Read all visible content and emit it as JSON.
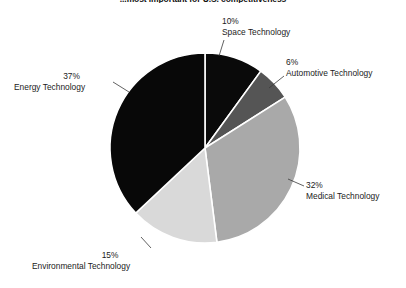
{
  "chart_data": {
    "type": "pie",
    "title": "...most important for U.S. competitiveness",
    "xlabel": "",
    "ylabel": "",
    "legend": "none",
    "grid": false,
    "start_angle_deg": 0,
    "direction": "clockwise",
    "categories": [
      "Space Technology",
      "Automotive Technology",
      "Medical Technology",
      "Environmental Technology",
      "Energy Technology"
    ],
    "values": [
      10,
      6,
      32,
      15,
      37
    ],
    "value_labels": [
      "10%",
      "6%",
      "32%",
      "15%",
      "37%"
    ],
    "unit": "%",
    "total": 100,
    "slices": [
      {
        "name": "Space Technology",
        "value": 10,
        "label": "10%",
        "color": "#0a0a0a",
        "start_deg": 0,
        "end_deg": 36
      },
      {
        "name": "Automotive Technology",
        "value": 6,
        "label": "6%",
        "color": "#555555",
        "start_deg": 36,
        "end_deg": 57.6
      },
      {
        "name": "Medical Technology",
        "value": 32,
        "label": "32%",
        "color": "#a9a9a9",
        "start_deg": 57.6,
        "end_deg": 172.8
      },
      {
        "name": "Environmental Technology",
        "value": 15,
        "label": "15%",
        "color": "#d9d9d9",
        "start_deg": 172.8,
        "end_deg": 226.8
      },
      {
        "name": "Energy Technology",
        "value": 37,
        "label": "37%",
        "color": "#080808",
        "start_deg": 226.8,
        "end_deg": 360
      }
    ]
  },
  "labels": {
    "space": {
      "pct": "10%",
      "name": "Space Technology"
    },
    "automotive": {
      "pct": "6%",
      "name": "Automotive Technology"
    },
    "medical": {
      "pct": "32%",
      "name": "Medical Technology"
    },
    "environmental": {
      "pct": "15%",
      "name": "Environmental Technology"
    },
    "energy": {
      "pct": "37%",
      "name": "Energy Technology"
    }
  }
}
